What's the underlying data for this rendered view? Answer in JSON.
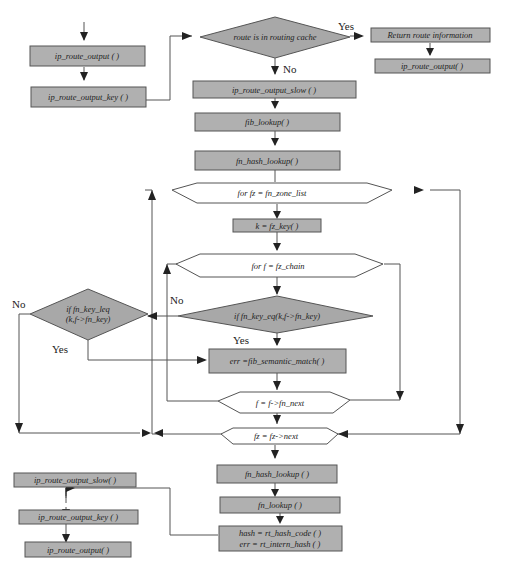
{
  "nodes": {
    "ip_route_output_1": "ip_route_output ( )",
    "ip_route_output_key_1": "ip_route_output_key ( )",
    "route_in_cache": "route is in routing cache",
    "return_route_info": "Return route information",
    "ip_route_output_2": "ip_route_output( )",
    "ip_route_output_slow_1": "ip_route_output_slow ( )",
    "fib_lookup": "fib_lookup( )",
    "fn_hash_lookup_1": "fn_hash_lookup( )",
    "for_fz": "for  fz = fn_zone_list",
    "k_fz_key": "k = fz_key( )",
    "for_f": "for  f = fz_chain",
    "if_fn_key_eq": "if  fn_key_eq(k,f->fn_key)",
    "if_fn_key_leq_line1": "if  fn_key_leq",
    "if_fn_key_leq_line2": "(k,f->fn_key)",
    "fib_semantic_match": "err =fib_semantic_match( )",
    "f_next": "f = f->fn_next",
    "fz_next": "fz = fz->next",
    "fn_hash_lookup_2": "fn_hash_lookup ( )",
    "fn_lookup": "fn_lookup ( )",
    "hash_line1": "hash = rt_hash_code ( )",
    "hash_line2": "err = rt_intern_hash ( )",
    "ip_route_output_slow_2": "ip_route_output_slow( )",
    "ip_route_output_key_2": "ip_route_output_key ( )",
    "ip_route_output_3": "ip_route_output( )"
  },
  "labels": {
    "yes_cache": "Yes",
    "no_cache": "No",
    "no_eq": "No",
    "yes_eq": "Yes",
    "no_leq": "No",
    "yes_leq": "Yes"
  },
  "colors": {
    "process_fill": "#b0b0b0",
    "decision_fill": "#a8a8a8",
    "loop_fill": "#ffffff",
    "line": "#555555"
  }
}
